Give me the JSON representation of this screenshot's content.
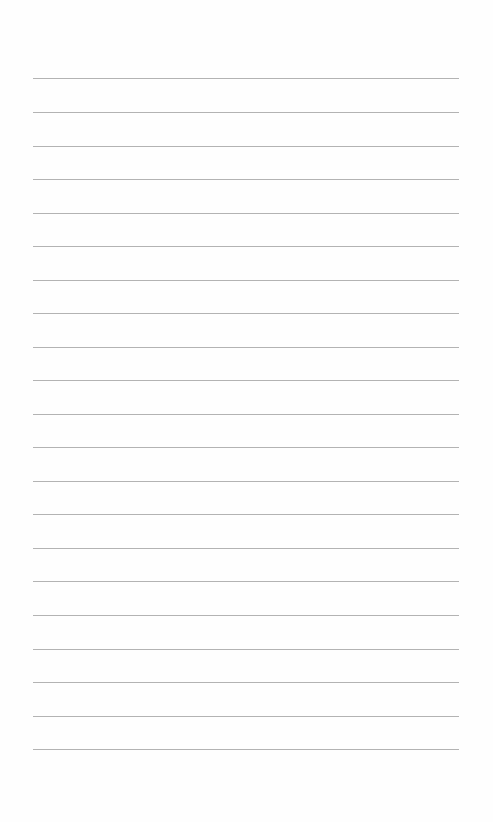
{
  "page": {
    "type": "lined-paper",
    "background_color": "#fefefe",
    "line_color": "#9a9a9a",
    "line_count": 21,
    "line_left": 33,
    "line_width": 426,
    "line_positions": [
      78,
      112,
      146,
      179,
      213,
      246,
      280,
      313,
      347,
      380,
      414,
      447,
      481,
      514,
      548,
      581,
      615,
      649,
      682,
      716,
      749
    ]
  }
}
